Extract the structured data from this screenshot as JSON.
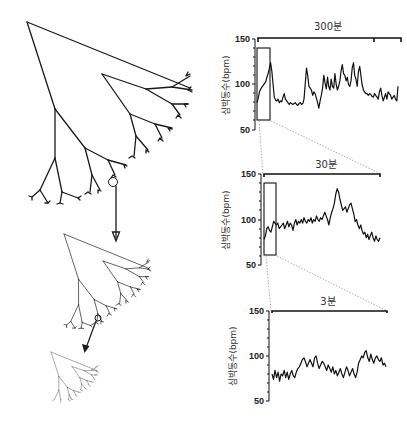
{
  "figure": {
    "left_panel": {
      "description": "Self-similar fractal branching tree shown at three successive magnifications",
      "trees": [
        {
          "name": "large-tree",
          "scale": 1.0
        },
        {
          "name": "medium-tree",
          "scale": 0.5
        },
        {
          "name": "small-tree",
          "scale": 0.27
        }
      ],
      "arrows": 2,
      "highlight_circles": 2
    },
    "colors": {
      "ink": "#111111",
      "guide": "#777777",
      "background": "#ffffff"
    }
  },
  "chart_data": [
    {
      "type": "line",
      "title": "300분",
      "xlabel": "",
      "ylabel": "심박동수(bpm)",
      "ylim": [
        50,
        150
      ],
      "yticks": [
        "150",
        "100",
        "50"
      ],
      "grid": false,
      "zoom_window": {
        "x_fraction": [
          0.0,
          0.09
        ],
        "y_range": [
          60,
          140
        ]
      },
      "values": [
        80,
        85,
        92,
        95,
        97,
        99,
        101,
        103,
        108,
        112,
        118,
        124,
        115,
        100,
        86,
        83,
        82,
        84,
        80,
        82,
        81,
        86,
        90,
        84,
        82,
        80,
        78,
        80,
        79,
        78,
        79,
        80,
        78,
        77,
        79,
        80,
        78,
        79,
        84,
        100,
        118,
        110,
        98,
        96,
        94,
        88,
        92,
        90,
        85,
        80,
        74,
        82,
        88,
        96,
        110,
        102,
        95,
        108,
        98,
        94,
        106,
        98,
        96,
        112,
        100,
        94,
        98,
        104,
        115,
        122,
        112,
        110,
        104,
        108,
        100,
        98,
        104,
        118,
        124,
        110,
        106,
        98,
        114,
        120,
        110,
        100,
        94,
        92,
        90,
        90,
        88,
        90,
        89,
        87,
        86,
        90,
        88,
        86,
        84,
        92,
        96,
        88,
        82,
        86,
        90,
        84,
        92,
        90,
        88,
        84,
        86,
        88,
        84,
        82,
        98
      ]
    },
    {
      "type": "line",
      "title": "30분",
      "xlabel": "",
      "ylabel": "심박동수(bpm)",
      "ylim": [
        50,
        150
      ],
      "yticks": [
        "150",
        "100",
        "50"
      ],
      "grid": false,
      "zoom_window": {
        "x_fraction": [
          0.0,
          0.1
        ],
        "y_range": [
          60,
          140
        ]
      },
      "values": [
        78,
        82,
        90,
        92,
        88,
        86,
        92,
        98,
        96,
        94,
        96,
        90,
        92,
        94,
        96,
        90,
        94,
        98,
        92,
        96,
        94,
        88,
        96,
        100,
        94,
        98,
        96,
        100,
        96,
        102,
        98,
        96,
        100,
        98,
        102,
        96,
        100,
        98,
        104,
        100,
        98,
        102,
        100,
        104,
        108,
        104,
        100,
        94,
        102,
        108,
        112,
        118,
        128,
        134,
        130,
        122,
        116,
        110,
        112,
        114,
        108,
        112,
        116,
        118,
        112,
        106,
        98,
        100,
        94,
        90,
        94,
        88,
        84,
        86,
        80,
        84,
        78,
        82,
        86,
        80,
        76,
        82,
        78,
        76,
        80
      ]
    },
    {
      "type": "line",
      "title": "3분",
      "xlabel": "",
      "ylabel": "심박동수(bpm)",
      "ylim": [
        50,
        150
      ],
      "yticks": [
        "150",
        "100",
        "50"
      ],
      "grid": false,
      "values": [
        80,
        74,
        84,
        76,
        82,
        72,
        80,
        78,
        84,
        76,
        82,
        74,
        80,
        84,
        78,
        76,
        82,
        86,
        88,
        92,
        96,
        98,
        94,
        88,
        92,
        96,
        92,
        88,
        98,
        100,
        92,
        86,
        90,
        94,
        92,
        88,
        84,
        90,
        86,
        82,
        88,
        80,
        84,
        78,
        82,
        86,
        80,
        76,
        82,
        88,
        84,
        78,
        82,
        86,
        80,
        76,
        82,
        92,
        96,
        100,
        98,
        104,
        106,
        98,
        94,
        102,
        96,
        92,
        98,
        100,
        96,
        94,
        98,
        90,
        92,
        88
      ]
    }
  ]
}
